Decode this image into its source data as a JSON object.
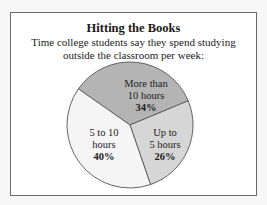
{
  "chart_data": {
    "type": "pie",
    "title": "Hitting the Books",
    "subtitle_lines": [
      "Time college students say they spend studying",
      "outside the classroom per week:"
    ],
    "slices": [
      {
        "label_lines": [
          "More than",
          "10 hours"
        ],
        "value": 34,
        "value_label": "34%",
        "color": "#b4b4b4"
      },
      {
        "label_lines": [
          "Up to",
          "5 hours"
        ],
        "value": 26,
        "value_label": "26%",
        "color": "#d6d6d6"
      },
      {
        "label_lines": [
          "5 to 10",
          "hours"
        ],
        "value": 40,
        "value_label": "40%",
        "color": "#f5f5f5"
      }
    ],
    "legend": "none (labels inside slices)"
  }
}
